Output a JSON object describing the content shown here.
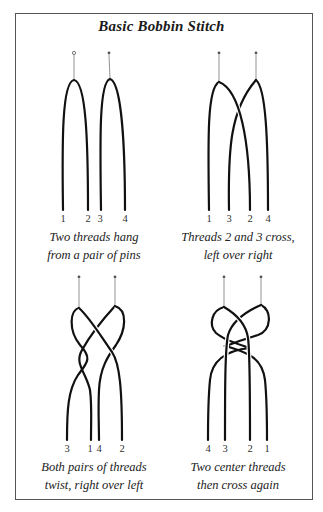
{
  "title": "Basic Bobbin Stitch",
  "panels": [
    {
      "id": "step-1",
      "labels": [
        "1",
        "2",
        "3",
        "4"
      ],
      "caption_line1": "Two threads hang",
      "caption_line2": "from a pair of pins"
    },
    {
      "id": "step-2",
      "labels": [
        "1",
        "3",
        "2",
        "4"
      ],
      "caption_line1": "Threads 2 and 3 cross,",
      "caption_line2": "left over right"
    },
    {
      "id": "step-3",
      "labels": [
        "3",
        "1",
        "4",
        "2"
      ],
      "caption_line1": "Both pairs of threads",
      "caption_line2": "twist, right over left"
    },
    {
      "id": "step-4",
      "labels": [
        "4",
        "3",
        "2",
        "1"
      ],
      "caption_line1": "Two center threads",
      "caption_line2": "then cross again"
    }
  ],
  "colors": {
    "ink": "#111111",
    "pin": "#555555",
    "frame": "#555555"
  }
}
